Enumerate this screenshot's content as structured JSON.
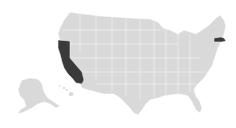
{
  "map": {
    "title": "United States",
    "colors": {
      "background": "#ffffff",
      "default_fill": "#d9d9d9",
      "highlight_fill": "#3a3a3a",
      "border": "#ffffff"
    },
    "highlighted_states": [
      "California",
      "Massachusetts"
    ],
    "regions": [
      {
        "id": "contiguous-us",
        "label": "Contiguous United States",
        "highlighted": false
      },
      {
        "id": "CA",
        "label": "California",
        "highlighted": true
      },
      {
        "id": "MA",
        "label": "Massachusetts",
        "highlighted": true
      },
      {
        "id": "AK",
        "label": "Alaska",
        "highlighted": false
      },
      {
        "id": "HI",
        "label": "Hawaii",
        "highlighted": false
      }
    ]
  }
}
